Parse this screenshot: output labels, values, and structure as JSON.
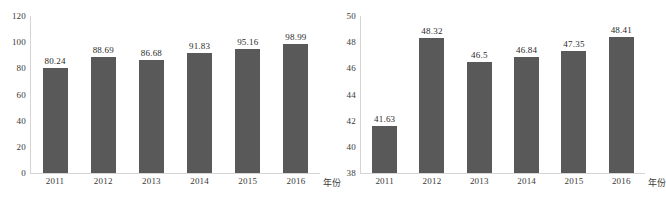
{
  "figure": {
    "background": "#ffffff",
    "bar_color": "#595959",
    "axis_color": "#d4d4d4",
    "text_color": "#3a3a3a"
  },
  "chart_data": [
    {
      "type": "bar",
      "panel": "left",
      "title": "",
      "xlabel": "年份",
      "ylabel": "",
      "categories": [
        "2011",
        "2012",
        "2013",
        "2014",
        "2015",
        "2016"
      ],
      "values": [
        80.24,
        88.69,
        86.68,
        91.83,
        95.16,
        98.99
      ],
      "value_labels": [
        "80.24",
        "88.69",
        "86.68",
        "91.83",
        "95.16",
        "98.99"
      ],
      "ylim": [
        0,
        120
      ],
      "yticks": [
        0,
        20,
        40,
        60,
        80,
        100,
        120
      ],
      "ytick_labels": [
        "0",
        "20",
        "40",
        "60",
        "80",
        "100",
        "120"
      ],
      "grid": false,
      "legend": false,
      "data_labels": true
    },
    {
      "type": "bar",
      "panel": "right",
      "title": "",
      "xlabel": "年份",
      "ylabel": "",
      "categories": [
        "2011",
        "2012",
        "2013",
        "2014",
        "2015",
        "2016"
      ],
      "values": [
        41.63,
        48.32,
        46.5,
        46.84,
        47.35,
        48.41
      ],
      "value_labels": [
        "41.63",
        "48.32",
        "46.5",
        "46.84",
        "47.35",
        "48.41"
      ],
      "ylim": [
        38,
        50
      ],
      "yticks": [
        38,
        40,
        42,
        44,
        46,
        48,
        50
      ],
      "ytick_labels": [
        "38",
        "40",
        "42",
        "44",
        "46",
        "48",
        "50"
      ],
      "grid": false,
      "legend": false,
      "data_labels": true
    }
  ]
}
